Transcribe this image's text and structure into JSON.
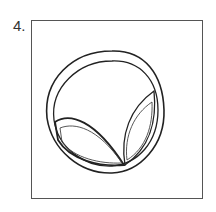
{
  "figure": {
    "number_label": "4.",
    "colors": {
      "stroke": "#222222",
      "frame": "#555555",
      "background": "#ffffff"
    }
  }
}
